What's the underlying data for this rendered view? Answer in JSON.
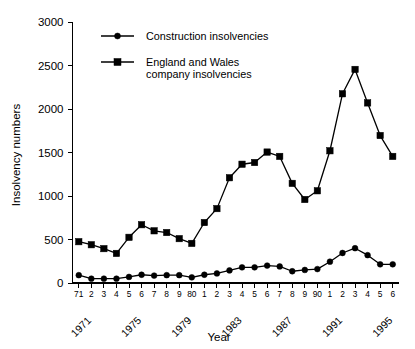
{
  "chart_data": {
    "type": "line",
    "title": "",
    "xlabel": "Year",
    "ylabel": "Insolvency numbers",
    "ylim": [
      0,
      3000
    ],
    "y_ticks": [
      0,
      500,
      1000,
      1500,
      2000,
      2500,
      3000
    ],
    "y_tick_labels": [
      "0",
      "500",
      "1000",
      "1500",
      "2000",
      "2500",
      "3000"
    ],
    "grid": false,
    "legend_position": "top-left-inside",
    "x": [
      1971,
      1972,
      1973,
      1974,
      1975,
      1976,
      1977,
      1978,
      1979,
      1980,
      1981,
      1982,
      1983,
      1984,
      1985,
      1986,
      1987,
      1988,
      1989,
      1990,
      1991,
      1992,
      1993,
      1994,
      1995,
      1996
    ],
    "x_tick_labels": [
      "71",
      "2",
      "3",
      "4",
      "5",
      "6",
      "7",
      "8",
      "9",
      "80",
      "1",
      "2",
      "3",
      "4",
      "5",
      "6",
      "7",
      "8",
      "9",
      "90",
      "1",
      "2",
      "3",
      "4",
      "5",
      "6"
    ],
    "x_year_labels": [
      {
        "index": 0,
        "label": "1971"
      },
      {
        "index": 4,
        "label": "1975"
      },
      {
        "index": 8,
        "label": "1979"
      },
      {
        "index": 12,
        "label": "1983"
      },
      {
        "index": 16,
        "label": "1987"
      },
      {
        "index": 20,
        "label": "1991"
      },
      {
        "index": 24,
        "label": "1995"
      }
    ],
    "series": [
      {
        "name": "Construction insolvencies",
        "marker": "circle",
        "values": [
          90,
          50,
          50,
          50,
          70,
          95,
          85,
          90,
          90,
          65,
          95,
          110,
          145,
          180,
          180,
          200,
          190,
          135,
          150,
          160,
          245,
          345,
          400,
          320,
          215,
          215
        ]
      },
      {
        "name": "England and Wales company insolvencies",
        "marker": "square",
        "values": [
          475,
          440,
          395,
          340,
          525,
          670,
          600,
          580,
          510,
          455,
          695,
          855,
          1210,
          1365,
          1385,
          1505,
          1455,
          1145,
          960,
          1060,
          1520,
          2175,
          2455,
          2070,
          1695,
          1455
        ]
      }
    ]
  },
  "legend": {
    "entries": [
      {
        "label": "Construction insolvencies",
        "marker": "circle"
      },
      {
        "label_line1": "England and Wales",
        "label_line2": "company insolvencies",
        "marker": "square"
      }
    ]
  },
  "axes": {
    "y_title": "Insolvency numbers",
    "x_title": "Year"
  }
}
